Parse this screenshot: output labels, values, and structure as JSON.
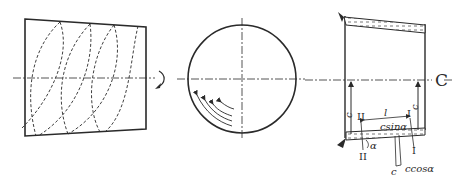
{
  "figure": {
    "panels": [
      {
        "id": "left",
        "description": "Developed cylinder surface with dashed helical lines",
        "centerline": true
      },
      {
        "id": "middle",
        "description": "End view circle with curved flow arrows",
        "arrow_count": 4
      },
      {
        "id": "right",
        "description": "Longitudinal section with deposit layers and velocity components",
        "labels": {
          "axis_symbol": "C",
          "c_left": "c",
          "c_right": "c",
          "section_II_top": "II",
          "section_II_bottom": "II",
          "section_I_top": "I",
          "section_I_bottom": "I",
          "length": "l",
          "csin": "csinα",
          "alpha": "α",
          "c_bottom": "c",
          "ccos": "ccosα"
        }
      }
    ],
    "colors": {
      "line": "#2a2a2a",
      "background": "#ffffff"
    }
  }
}
